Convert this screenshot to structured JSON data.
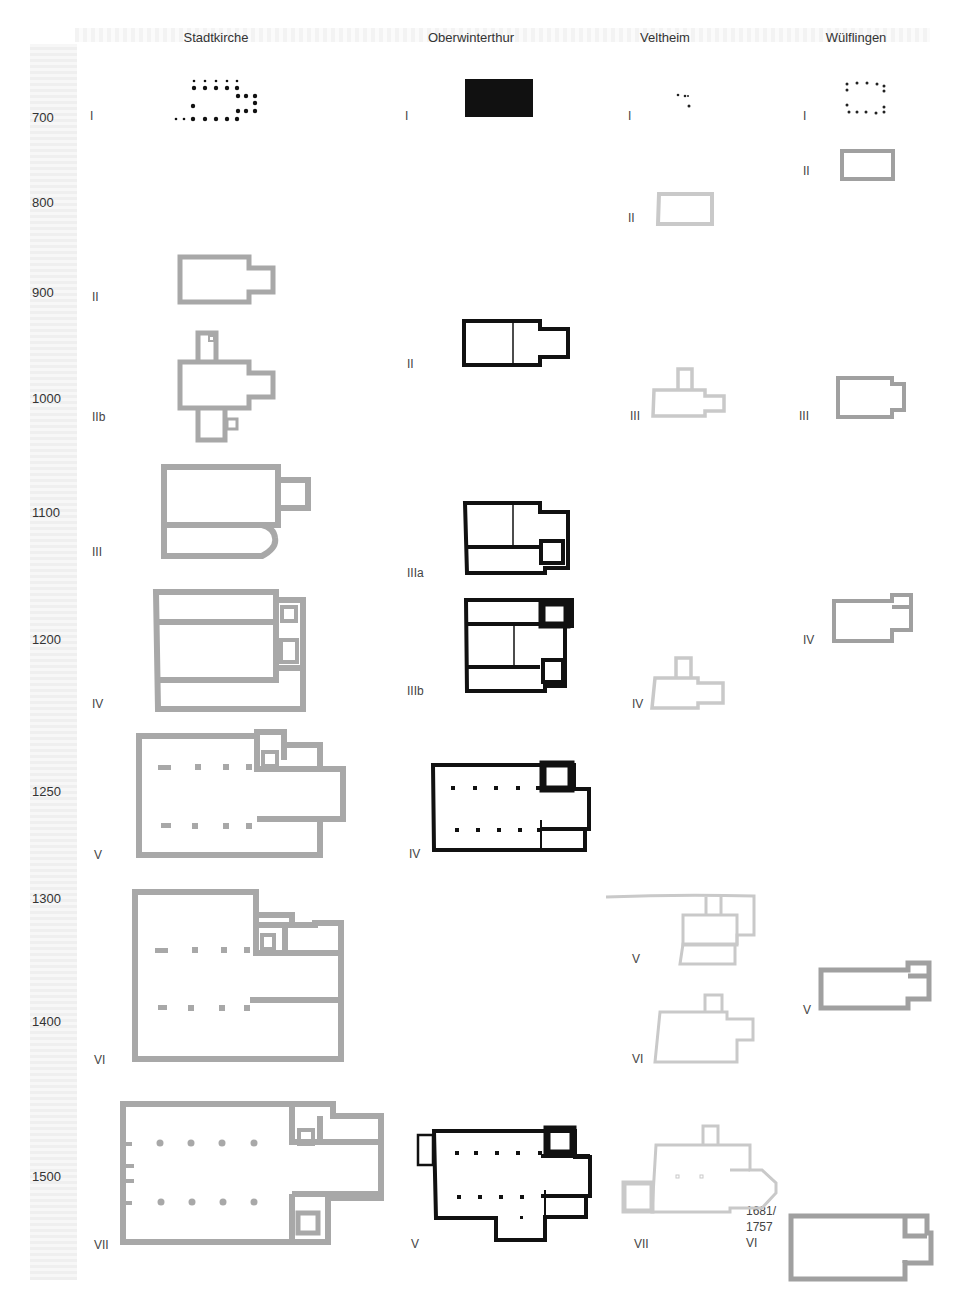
{
  "columns": [
    {
      "name": "Stadtkirche",
      "x": 216
    },
    {
      "name": "Oberwinterthur",
      "x": 471
    },
    {
      "name": "Veltheim",
      "x": 665
    },
    {
      "name": "Wülflingen",
      "x": 856
    }
  ],
  "timeline": [
    {
      "year": "700",
      "y": 110
    },
    {
      "year": "800",
      "y": 195
    },
    {
      "year": "900",
      "y": 285
    },
    {
      "year": "1000",
      "y": 391
    },
    {
      "year": "1100",
      "y": 505
    },
    {
      "year": "1200",
      "y": 632
    },
    {
      "year": "1250",
      "y": 784
    },
    {
      "year": "1300",
      "y": 891
    },
    {
      "year": "1400",
      "y": 1014
    },
    {
      "year": "1500",
      "y": 1169
    }
  ],
  "phases": {
    "stadtkirche": [
      {
        "label": "I",
        "x": 90,
        "y": 108
      },
      {
        "label": "II",
        "x": 92,
        "y": 289
      },
      {
        "label": "IIb",
        "x": 92,
        "y": 409
      },
      {
        "label": "III",
        "x": 92,
        "y": 544
      },
      {
        "label": "IV",
        "x": 92,
        "y": 696
      },
      {
        "label": "V",
        "x": 94,
        "y": 847
      },
      {
        "label": "VI",
        "x": 94,
        "y": 1052
      },
      {
        "label": "VII",
        "x": 94,
        "y": 1237
      }
    ],
    "oberwinterthur": [
      {
        "label": "I",
        "x": 405,
        "y": 108
      },
      {
        "label": "II",
        "x": 407,
        "y": 356
      },
      {
        "label": "IIIa",
        "x": 407,
        "y": 565
      },
      {
        "label": "IIIb",
        "x": 407,
        "y": 683
      },
      {
        "label": "IV",
        "x": 409,
        "y": 846
      },
      {
        "label": "V",
        "x": 411,
        "y": 1236
      }
    ],
    "veltheim": [
      {
        "label": "I",
        "x": 628,
        "y": 108
      },
      {
        "label": "II",
        "x": 628,
        "y": 210
      },
      {
        "label": "III",
        "x": 630,
        "y": 408
      },
      {
        "label": "IV",
        "x": 632,
        "y": 696
      },
      {
        "label": "V",
        "x": 632,
        "y": 951
      },
      {
        "label": "VI",
        "x": 632,
        "y": 1051
      },
      {
        "label": "VII",
        "x": 634,
        "y": 1236
      }
    ],
    "wuelflingen": [
      {
        "label": "I",
        "x": 803,
        "y": 108
      },
      {
        "label": "II",
        "x": 803,
        "y": 163
      },
      {
        "label": "III",
        "x": 799,
        "y": 408
      },
      {
        "label": "IV",
        "x": 803,
        "y": 632
      },
      {
        "label": "V",
        "x": 803,
        "y": 1002
      },
      {
        "label": "1681/\n1757\nVI",
        "x": 746,
        "y": 1203
      }
    ]
  },
  "colors": {
    "stadtkirche": "#a8a8a8",
    "oberwinterthur": "#111111",
    "veltheim": "#cfcfcf",
    "wuelflingen": "#a0a0a0"
  }
}
